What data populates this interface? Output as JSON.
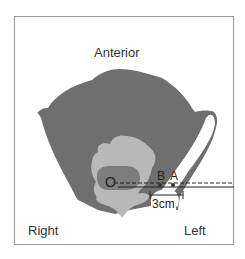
{
  "figure": {
    "orientation_labels": {
      "top": "Anterior",
      "bottom_left": "Right",
      "bottom_right": "Left"
    },
    "points": {
      "origin": "O",
      "point_b": "B",
      "point_a": "A"
    },
    "measurement": "3cm",
    "colors": {
      "soft_tissue": "#6f6f6f",
      "bone": "#ffffff",
      "organ_light": "#b8b8b8",
      "organ_dark": "#7d7d7d",
      "frame": "#9a9a9a",
      "line": "#222222"
    },
    "lines": [
      {
        "style": "dashed",
        "from": "O",
        "to": "right-edge"
      },
      {
        "style": "solid",
        "from": "O",
        "to": "right-edge"
      }
    ]
  }
}
